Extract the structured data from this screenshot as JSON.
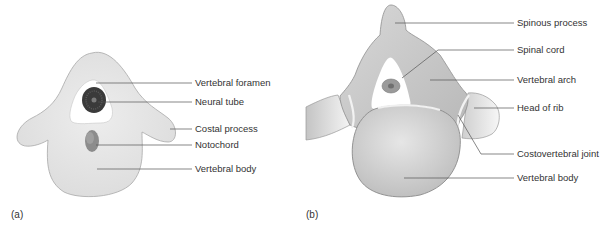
{
  "figure": {
    "panel_a": {
      "label": "(a)",
      "callouts": [
        {
          "text": "Vertebral foramen"
        },
        {
          "text": "Neural tube"
        },
        {
          "text": "Costal process"
        },
        {
          "text": "Notochord"
        },
        {
          "text": "Vertebral body"
        }
      ]
    },
    "panel_b": {
      "label": "(b)",
      "callouts": [
        {
          "text": "Spinous process"
        },
        {
          "text": "Spinal cord"
        },
        {
          "text": "Vertebral arch"
        },
        {
          "text": "Head of rib"
        },
        {
          "text": "Costovertebral joint"
        },
        {
          "text": "Vertebral body"
        }
      ]
    },
    "colors": {
      "bone_light": "#e8e8e8",
      "bone_mid": "#cfcfcf",
      "outline": "#9a9a9a",
      "neural_tube": "#3a3a3a",
      "notochord": "#8c8c8c",
      "leader": "#555555"
    }
  }
}
